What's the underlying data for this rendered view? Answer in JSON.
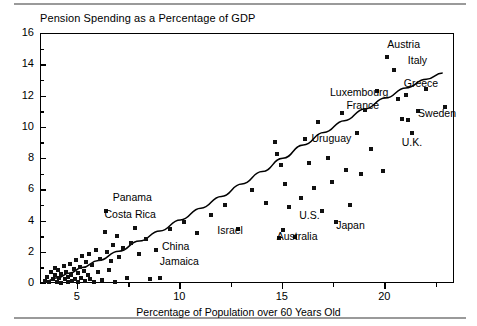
{
  "chart_data": {
    "type": "scatter",
    "title": "Pension Spending as a Percentage of GDP",
    "xlabel": "Percentage of Population over 60 Years Old",
    "ylabel": "",
    "xlim": [
      3.2,
      23.4
    ],
    "ylim": [
      0,
      16
    ],
    "xticks": [
      5,
      10,
      15,
      20
    ],
    "yticks": [
      0,
      2,
      4,
      6,
      8,
      10,
      12,
      14,
      16
    ],
    "yminorticks": [
      1,
      3,
      5,
      7,
      9,
      11,
      13,
      15
    ],
    "grid": false,
    "legend": "none",
    "trendline": {
      "label": "fitted curve",
      "points": [
        [
          3.4,
          0.15
        ],
        [
          4.0,
          0.4
        ],
        [
          4.6,
          0.7
        ],
        [
          5.2,
          1.05
        ],
        [
          6.0,
          1.5
        ],
        [
          7.0,
          2.1
        ],
        [
          8.0,
          2.75
        ],
        [
          9.0,
          3.4
        ],
        [
          10.0,
          4.1
        ],
        [
          11.0,
          4.85
        ],
        [
          12.0,
          5.6
        ],
        [
          13.0,
          6.4
        ],
        [
          14.0,
          7.2
        ],
        [
          15.0,
          8.05
        ],
        [
          16.0,
          8.9
        ],
        [
          17.0,
          9.7
        ],
        [
          18.0,
          10.45
        ],
        [
          19.0,
          11.2
        ],
        [
          20.0,
          11.9
        ],
        [
          21.0,
          12.55
        ],
        [
          22.0,
          13.1
        ],
        [
          22.8,
          13.5
        ]
      ]
    },
    "points": [
      [
        3.4,
        0.2
      ],
      [
        3.5,
        0.45
      ],
      [
        3.6,
        0.1
      ],
      [
        3.7,
        0.75
      ],
      [
        3.8,
        0.3
      ],
      [
        3.9,
        0.55
      ],
      [
        3.9,
        1.0
      ],
      [
        4.0,
        0.15
      ],
      [
        4.05,
        0.9
      ],
      [
        4.1,
        0.4
      ],
      [
        4.2,
        0.65
      ],
      [
        4.2,
        0.05
      ],
      [
        4.3,
        1.15
      ],
      [
        4.35,
        0.3
      ],
      [
        4.4,
        0.8
      ],
      [
        4.5,
        0.45
      ],
      [
        4.5,
        0.1
      ],
      [
        4.6,
        1.3
      ],
      [
        4.65,
        0.6
      ],
      [
        4.7,
        0.2
      ],
      [
        4.8,
        0.95
      ],
      [
        4.85,
        0.35
      ],
      [
        4.9,
        1.55
      ],
      [
        5.0,
        0.7
      ],
      [
        5.0,
        0.15
      ],
      [
        5.1,
        1.1
      ],
      [
        5.15,
        0.4
      ],
      [
        5.2,
        1.8
      ],
      [
        5.3,
        0.85
      ],
      [
        5.35,
        0.2
      ],
      [
        5.4,
        1.4
      ],
      [
        5.5,
        0.55
      ],
      [
        5.55,
        1.95
      ],
      [
        5.6,
        0.3
      ],
      [
        5.7,
        1.2
      ],
      [
        5.8,
        0.1
      ],
      [
        5.9,
        2.2
      ],
      [
        6.0,
        0.75
      ],
      [
        6.1,
        1.6
      ],
      [
        6.2,
        0.25
      ],
      [
        6.3,
        3.35
      ],
      [
        6.35,
        4.65
      ],
      [
        6.4,
        2.05
      ],
      [
        6.5,
        0.9
      ],
      [
        6.6,
        1.45
      ],
      [
        6.7,
        2.5
      ],
      [
        6.8,
        0.15
      ],
      [
        6.9,
        3.05
      ],
      [
        7.0,
        1.75
      ],
      [
        7.2,
        2.3
      ],
      [
        7.4,
        0.4
      ],
      [
        7.6,
        2.6
      ],
      [
        7.8,
        3.6
      ],
      [
        8.0,
        1.9
      ],
      [
        8.3,
        2.85
      ],
      [
        8.5,
        0.35
      ],
      [
        8.8,
        2.2
      ],
      [
        9.0,
        0.4
      ],
      [
        9.5,
        3.55
      ],
      [
        10.2,
        3.95
      ],
      [
        10.8,
        3.25
      ],
      [
        11.5,
        4.4
      ],
      [
        12.2,
        5.05
      ],
      [
        12.8,
        3.5
      ],
      [
        13.5,
        6.0
      ],
      [
        14.2,
        5.2
      ],
      [
        14.6,
        9.1
      ],
      [
        14.7,
        8.3
      ],
      [
        14.8,
        2.95
      ],
      [
        14.9,
        7.6
      ],
      [
        15.0,
        3.45
      ],
      [
        15.1,
        6.4
      ],
      [
        15.3,
        4.95
      ],
      [
        15.6,
        3.0
      ],
      [
        15.9,
        5.5
      ],
      [
        16.1,
        9.3
      ],
      [
        16.3,
        7.75
      ],
      [
        16.5,
        6.15
      ],
      [
        16.7,
        10.35
      ],
      [
        16.9,
        4.65
      ],
      [
        17.2,
        8.05
      ],
      [
        17.4,
        6.55
      ],
      [
        17.6,
        3.95
      ],
      [
        17.9,
        10.95
      ],
      [
        18.1,
        7.3
      ],
      [
        18.3,
        5.05
      ],
      [
        18.6,
        9.65
      ],
      [
        18.8,
        7.05
      ],
      [
        19.0,
        11.15
      ],
      [
        19.3,
        8.65
      ],
      [
        19.6,
        12.35
      ],
      [
        19.9,
        7.25
      ],
      [
        20.1,
        14.5
      ],
      [
        20.4,
        13.7
      ],
      [
        20.6,
        11.85
      ],
      [
        20.8,
        10.55
      ],
      [
        21.0,
        12.1
      ],
      [
        21.1,
        10.5
      ],
      [
        21.3,
        9.65
      ],
      [
        21.6,
        11.05
      ],
      [
        22.0,
        12.45
      ],
      [
        22.9,
        11.3
      ]
    ],
    "annotations": [
      {
        "label": "Austria",
        "x": 20.1,
        "y": 15.3
      },
      {
        "label": "Italy",
        "x": 21.1,
        "y": 14.3
      },
      {
        "label": "Greece",
        "x": 20.9,
        "y": 12.8
      },
      {
        "label": "Luxembourg",
        "x": 17.3,
        "y": 12.2
      },
      {
        "label": "France",
        "x": 18.1,
        "y": 11.4
      },
      {
        "label": "Sweden",
        "x": 21.6,
        "y": 10.9
      },
      {
        "label": "Uruguay",
        "x": 16.4,
        "y": 9.25
      },
      {
        "label": "U.K.",
        "x": 20.8,
        "y": 9.0
      },
      {
        "label": "Panama",
        "x": 6.7,
        "y": 5.5
      },
      {
        "label": "Costa Rica",
        "x": 6.3,
        "y": 4.4
      },
      {
        "label": "Israel",
        "x": 11.8,
        "y": 3.4
      },
      {
        "label": "U.S.",
        "x": 15.8,
        "y": 4.35
      },
      {
        "label": "Japan",
        "x": 17.6,
        "y": 3.7
      },
      {
        "label": "Australia",
        "x": 14.7,
        "y": 3.0
      },
      {
        "label": "China",
        "x": 9.1,
        "y": 2.4
      },
      {
        "label": "Jamaica",
        "x": 9.0,
        "y": 1.4
      }
    ]
  }
}
